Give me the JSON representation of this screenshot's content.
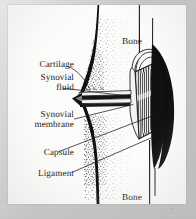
{
  "figure": {
    "medium": "black-and-white line drawing with stipple shading on scanned paper",
    "page_background_color": "#fbfbfa",
    "scan_border_color": "#c8c8c6",
    "ink_color": "#1b1b1b"
  },
  "labels": {
    "cartilage": "Cartilage",
    "synovial_fluid_line1": "Synovial",
    "synovial_fluid_line2": "fluid",
    "synovial_membrane_line1": "Synovial",
    "synovial_membrane_line2": "membrane",
    "capsule": "Capsule",
    "ligament": "Ligament",
    "bone_top": "Bone",
    "bone_bottom": "Bone"
  },
  "anatomy_parts": [
    {
      "name": "bone-upper",
      "label": "Bone",
      "side": "top",
      "rendering": "stippled shaft with dark cortical outline"
    },
    {
      "name": "bone-lower",
      "label": "Bone",
      "side": "bottom",
      "rendering": "stippled shaft with dark cortical outline"
    },
    {
      "name": "articular-cartilage",
      "label": "Cartilage",
      "rendering": "pale band on each joint surface"
    },
    {
      "name": "synovial-fluid",
      "label": "Synovial fluid",
      "rendering": "narrow dark joint cavity between cartilage layers"
    },
    {
      "name": "synovial-membrane",
      "label": "Synovial membrane",
      "rendering": "thin lining enclosing the joint cavity"
    },
    {
      "name": "joint-capsule",
      "label": "Capsule",
      "rendering": "fibrous sleeve with vertical striations"
    },
    {
      "name": "ligament",
      "label": "Ligament",
      "rendering": "dark crescent band reinforcing the joint laterally"
    }
  ],
  "leader_lines": [
    {
      "from_label": "Cartilage",
      "direction": "right-and-down-to-joint-surface"
    },
    {
      "from_label": "Synovial fluid",
      "direction": "right-to-joint-cavity"
    },
    {
      "from_label": "Synovial membrane",
      "direction": "right-and-up-to-capsule-lining"
    },
    {
      "from_label": "Capsule",
      "direction": "right-and-up-to-striated-sleeve"
    },
    {
      "from_label": "Ligament",
      "direction": "right-and-up-to-dark-crescent"
    }
  ]
}
